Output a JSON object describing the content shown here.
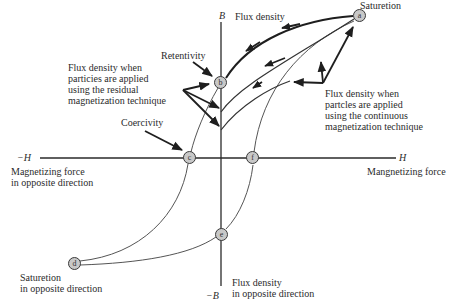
{
  "diagram": {
    "type": "magnetic hysteresis loop",
    "axes": {
      "vertical_positive": "B",
      "vertical_positive_label": "Flux density",
      "vertical_negative": "−B",
      "vertical_negative_label": "Flux density\nin opposite direction",
      "horizontal_positive": "H",
      "horizontal_positive_label": "Mangnetizing force",
      "horizontal_negative": "−H",
      "horizontal_negative_label": "Magnetizing force\nin opposite direction"
    },
    "nodes": [
      {
        "id": "a",
        "label": "a",
        "meaning": "Saturetion"
      },
      {
        "id": "b",
        "label": "b",
        "meaning": "Retentivity"
      },
      {
        "id": "c",
        "label": "c",
        "meaning": "Coercivity"
      },
      {
        "id": "d",
        "label": "d",
        "meaning": "Saturetion in opposite direction"
      },
      {
        "id": "e",
        "label": "e",
        "meaning": ""
      },
      {
        "id": "f",
        "label": "f",
        "meaning": ""
      }
    ],
    "annotations": {
      "saturation": "Saturetion",
      "retentivity": "Retentivity",
      "coercivity": "Coercivity",
      "residual": "Flux density when\nparticies are applied\nusing the residual\nmagnetization technique",
      "continuous": "Flux density when\npartcles are applied\nusing the continuous\nmagnetization technique",
      "saturation_opposite": "Saturetion\nin opposite direction"
    },
    "colors": {
      "line": "#2a2a2a",
      "curve": "#555555",
      "node_fill": "#c8c8c8",
      "node_stroke": "#3a3a3a"
    }
  }
}
